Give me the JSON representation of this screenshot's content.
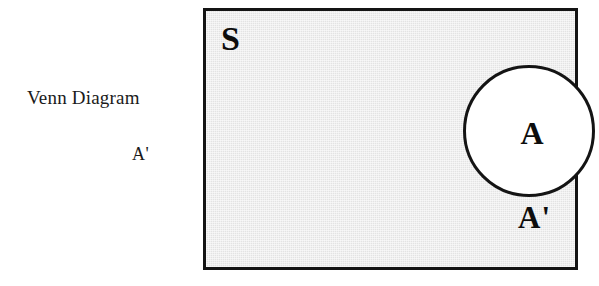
{
  "figure": {
    "caption": "Venn Diagram",
    "caption_sub": "A'"
  },
  "diagram": {
    "type": "venn",
    "universe_label": "S",
    "complement_label": "A'",
    "set_label": "A",
    "colors": {
      "universe_fill": "#e3e3e3",
      "set_fill": "#ffffff",
      "stroke": "#141414",
      "page_background": "#ffffff",
      "text": "#0d0d0d"
    }
  }
}
